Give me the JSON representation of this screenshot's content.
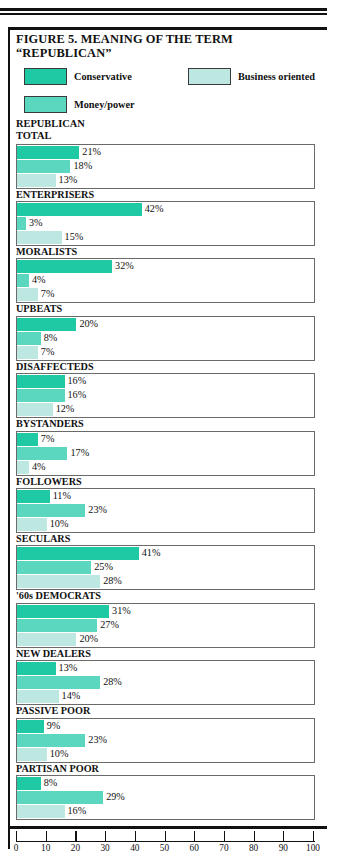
{
  "figure": {
    "title_line1": "FIGURE 5. MEANING OF THE TERM",
    "title_line2": "“REPUBLICAN”",
    "caption_line1": "REPUBLICAN",
    "caption_line2": "TOTAL"
  },
  "legend": {
    "conservative": "Conservative",
    "business": "Business oriented",
    "money": "Money/power"
  },
  "colors": {
    "conservative": "#1ec9a4",
    "money": "#5bd7c0",
    "business": "#bde8e2",
    "bar_border": "#6a6a6a",
    "rule": "#111111"
  },
  "chart_data": {
    "type": "bar",
    "orientation": "horizontal",
    "title": "FIGURE 5. MEANING OF THE TERM “REPUBLICAN”",
    "xlabel": "",
    "ylabel": "",
    "xlim": [
      0,
      100
    ],
    "grid": false,
    "legend_position": "top",
    "tick_labels": [
      "0",
      "10",
      "20",
      "30",
      "40",
      "50",
      "60",
      "70",
      "80",
      "90",
      "100"
    ],
    "ticks": [
      0,
      10,
      20,
      30,
      40,
      50,
      60,
      70,
      80,
      90,
      100
    ],
    "series": [
      {
        "name": "Conservative",
        "values": [
          21,
          42,
          32,
          20,
          16,
          7,
          11,
          41,
          31,
          13,
          9,
          8
        ]
      },
      {
        "name": "Money/power",
        "values": [
          18,
          3,
          4,
          8,
          16,
          17,
          23,
          25,
          27,
          28,
          23,
          29
        ]
      },
      {
        "name": "Business oriented",
        "values": [
          13,
          15,
          7,
          7,
          12,
          4,
          10,
          28,
          20,
          14,
          10,
          16
        ]
      }
    ],
    "categories": [
      "TOTAL",
      "ENTERPRISERS",
      "MORALISTS",
      "UPBEATS",
      "DISAFFECTEDS",
      "BYSTANDERS",
      "FOLLOWERS",
      "SECULARS",
      "'60s DEMOCRATS",
      "NEW DEALERS",
      "PASSIVE POOR",
      "PARTISAN POOR"
    ],
    "groups": [
      {
        "label": "TOTAL",
        "label_shown": false,
        "bars": [
          {
            "series": "Conservative",
            "value": 21,
            "label": "21%"
          },
          {
            "series": "Money/power",
            "value": 18,
            "label": "18%"
          },
          {
            "series": "Business oriented",
            "value": 13,
            "label": "13%"
          }
        ]
      },
      {
        "label": "ENTERPRISERS",
        "label_shown": true,
        "bars": [
          {
            "series": "Conservative",
            "value": 42,
            "label": "42%"
          },
          {
            "series": "Money/power",
            "value": 3,
            "label": "3%"
          },
          {
            "series": "Business oriented",
            "value": 15,
            "label": "15%"
          }
        ]
      },
      {
        "label": "MORALISTS",
        "label_shown": true,
        "bars": [
          {
            "series": "Conservative",
            "value": 32,
            "label": "32%"
          },
          {
            "series": "Money/power",
            "value": 4,
            "label": "4%"
          },
          {
            "series": "Business oriented",
            "value": 7,
            "label": "7%"
          }
        ]
      },
      {
        "label": "UPBEATS",
        "label_shown": true,
        "bars": [
          {
            "series": "Conservative",
            "value": 20,
            "label": "20%"
          },
          {
            "series": "Money/power",
            "value": 8,
            "label": "8%"
          },
          {
            "series": "Business oriented",
            "value": 7,
            "label": "7%"
          }
        ]
      },
      {
        "label": "DISAFFECTEDS",
        "label_shown": true,
        "bars": [
          {
            "series": "Conservative",
            "value": 16,
            "label": "16%"
          },
          {
            "series": "Money/power",
            "value": 16,
            "label": "16%"
          },
          {
            "series": "Business oriented",
            "value": 12,
            "label": "12%"
          }
        ]
      },
      {
        "label": "BYSTANDERS",
        "label_shown": true,
        "bars": [
          {
            "series": "Conservative",
            "value": 7,
            "label": "7%"
          },
          {
            "series": "Money/power",
            "value": 17,
            "label": "17%"
          },
          {
            "series": "Business oriented",
            "value": 4,
            "label": "4%"
          }
        ]
      },
      {
        "label": "FOLLOWERS",
        "label_shown": true,
        "bars": [
          {
            "series": "Conservative",
            "value": 11,
            "label": "11%"
          },
          {
            "series": "Money/power",
            "value": 23,
            "label": "23%"
          },
          {
            "series": "Business oriented",
            "value": 10,
            "label": "10%"
          }
        ]
      },
      {
        "label": "SECULARS",
        "label_shown": true,
        "bars": [
          {
            "series": "Conservative",
            "value": 41,
            "label": "41%"
          },
          {
            "series": "Money/power",
            "value": 25,
            "label": "25%"
          },
          {
            "series": "Business oriented",
            "value": 28,
            "label": "28%"
          }
        ]
      },
      {
        "label": "'60s DEMOCRATS",
        "label_shown": true,
        "bars": [
          {
            "series": "Conservative",
            "value": 31,
            "label": "31%"
          },
          {
            "series": "Money/power",
            "value": 27,
            "label": "27%"
          },
          {
            "series": "Business oriented",
            "value": 20,
            "label": "20%"
          }
        ]
      },
      {
        "label": "NEW DEALERS",
        "label_shown": true,
        "bars": [
          {
            "series": "Conservative",
            "value": 13,
            "label": "13%"
          },
          {
            "series": "Money/power",
            "value": 28,
            "label": "28%"
          },
          {
            "series": "Business oriented",
            "value": 14,
            "label": "14%"
          }
        ]
      },
      {
        "label": "PASSIVE POOR",
        "label_shown": true,
        "bars": [
          {
            "series": "Conservative",
            "value": 9,
            "label": "9%"
          },
          {
            "series": "Money/power",
            "value": 23,
            "label": "23%"
          },
          {
            "series": "Business oriented",
            "value": 10,
            "label": "10%"
          }
        ]
      },
      {
        "label": "PARTISAN POOR",
        "label_shown": true,
        "bars": [
          {
            "series": "Conservative",
            "value": 8,
            "label": "8%"
          },
          {
            "series": "Money/power",
            "value": 29,
            "label": "29%"
          },
          {
            "series": "Business oriented",
            "value": 16,
            "label": "16%"
          }
        ]
      }
    ]
  }
}
